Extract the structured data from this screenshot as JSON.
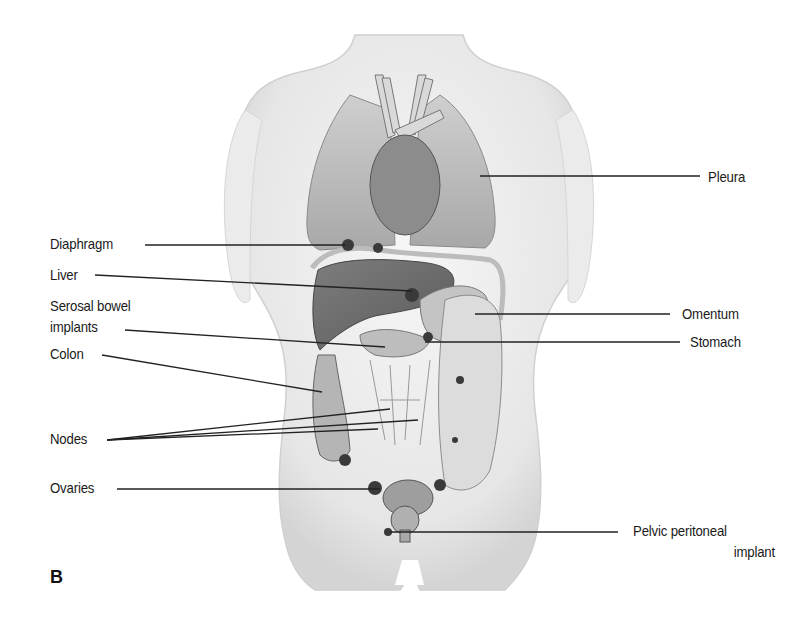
{
  "figure": {
    "panel_label": "B",
    "labels_left": [
      {
        "id": "diaphragm",
        "text": "Diaphragm"
      },
      {
        "id": "liver",
        "text": "Liver"
      },
      {
        "id": "serosal",
        "text_line1": "Serosal bowel",
        "text_line2": "implants"
      },
      {
        "id": "colon",
        "text": "Colon"
      },
      {
        "id": "nodes",
        "text": "Nodes"
      },
      {
        "id": "ovaries",
        "text": "Ovaries"
      }
    ],
    "labels_right": [
      {
        "id": "pleura",
        "text": "Pleura"
      },
      {
        "id": "omentum",
        "text": "Omentum"
      },
      {
        "id": "stomach",
        "text": "Stomach"
      },
      {
        "id": "pelvic",
        "text_line1": "Pelvic peritoneal",
        "text_line2": "implant"
      }
    ],
    "colors": {
      "line": "#222222",
      "skin": "#efefef",
      "organ_dark": "#6e6e6e",
      "organ_mid": "#9a9a9a",
      "lung": "#b9b9b9",
      "tumor": "#3a3a3a"
    }
  }
}
